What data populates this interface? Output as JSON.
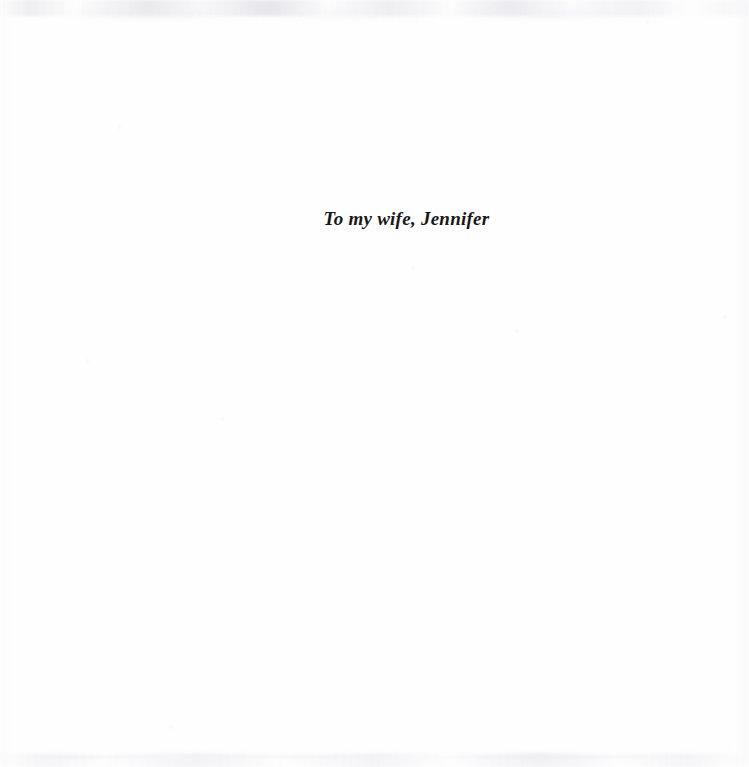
{
  "page": {
    "type": "book-dedication-page",
    "width": 749,
    "height": 767,
    "background_color": "#fefefe",
    "text_color": "#181818"
  },
  "dedication": {
    "text": "To my wife, Jennifer",
    "style": "bold-italic-serif",
    "alignment": "centered"
  },
  "artifacts": {
    "top_edge": "scan-smudge-band",
    "bottom_edge": "scan-smudge-band",
    "left_edge": "scan-shadow",
    "right_edge": "scan-shadow",
    "specks": [
      {
        "x": 300,
        "y": 14,
        "size": 2
      },
      {
        "x": 118,
        "y": 126,
        "size": 2
      },
      {
        "x": 412,
        "y": 267,
        "size": 2
      },
      {
        "x": 86,
        "y": 360,
        "size": 2
      },
      {
        "x": 222,
        "y": 418,
        "size": 2
      },
      {
        "x": 724,
        "y": 316,
        "size": 2
      },
      {
        "x": 170,
        "y": 726,
        "size": 2
      },
      {
        "x": 516,
        "y": 330,
        "size": 2
      },
      {
        "x": 646,
        "y": 21,
        "size": 2
      }
    ]
  }
}
